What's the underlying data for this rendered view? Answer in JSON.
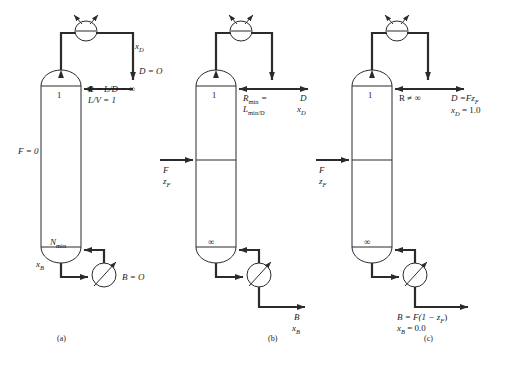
{
  "figure": {
    "panels": [
      {
        "id": "a",
        "caption": "(a)",
        "case": "Total reflux / minimum stages",
        "column": {
          "top_stage_label": "1",
          "bottom_stage_label": "N",
          "bottom_stage_sub": "min",
          "feed_label": "F = 0",
          "has_feed_stream": false
        },
        "condenser": {
          "icon": "condenser-icon",
          "distillate_comp": "x",
          "distillate_comp_sub": "D",
          "distillate_flow": "D = O"
        },
        "reflux": {
          "line1": "R = L/D = ∞",
          "line2": "L/V = 1"
        },
        "reboiler": {
          "icon": "reboiler-icon",
          "bottoms_comp": "x",
          "bottoms_comp_sub": "B",
          "bottoms_flow": "B = O"
        }
      },
      {
        "id": "b",
        "caption": "(b)",
        "case": "Minimum reflux / infinite stages",
        "column": {
          "top_stage_label": "1",
          "bottom_stage_label": "∞",
          "has_feed_stream": true,
          "feed_flow": "F",
          "feed_comp": "z",
          "feed_comp_sub": "F"
        },
        "condenser": {
          "icon": "condenser-icon",
          "distillate_flow": "D",
          "distillate_comp": "x",
          "distillate_comp_sub": "D"
        },
        "reflux": {
          "line1_main": "R",
          "line1_sub": "min",
          "line1_tail": " =",
          "line2_main": "L",
          "line2_sub": "min/D"
        },
        "reboiler": {
          "icon": "reboiler-icon",
          "bottoms_flow": "B",
          "bottoms_comp": "x",
          "bottoms_comp_sub": "B"
        }
      },
      {
        "id": "c",
        "caption": "(c)",
        "case": "Perfect separation",
        "column": {
          "top_stage_label": "1",
          "bottom_stage_label": "∞",
          "has_feed_stream": true,
          "feed_flow": "F",
          "feed_comp": "z",
          "feed_comp_sub": "F"
        },
        "condenser": {
          "icon": "condenser-icon",
          "distillate_line1": "D =Fz",
          "distillate_line1_sub": "F",
          "distillate_line2": "x",
          "distillate_line2_sub": "D",
          "distillate_line2_tail": " = 1.0"
        },
        "reflux": {
          "line1": "R ≠ ∞"
        },
        "reboiler": {
          "icon": "reboiler-icon",
          "bottoms_line1": "B = F(1 − z",
          "bottoms_line1_sub": "F",
          "bottoms_line1_tail": ")",
          "bottoms_line2": "x",
          "bottoms_line2_sub": "B",
          "bottoms_line2_tail": " = 0.0"
        }
      }
    ]
  },
  "colors": {
    "stroke": "#2b2b2b",
    "background": "#ffffff"
  }
}
